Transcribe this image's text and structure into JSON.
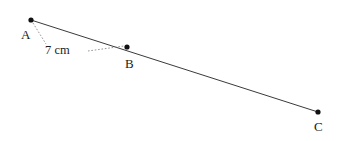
{
  "figure": {
    "kind": "geometry-line-diagram",
    "width": 339,
    "height": 141,
    "background_color": "#ffffff",
    "stroke_color": "#3a3a3a",
    "dot_color": "#111111",
    "dashed_color": "#8a8a8a"
  },
  "points": {
    "a": {
      "label": "A",
      "x": 31,
      "y": 20
    },
    "b": {
      "label": "B",
      "x": 127,
      "y": 47
    },
    "c": {
      "label": "C",
      "x": 318,
      "y": 112
    }
  },
  "segments": {
    "main_line": {
      "from": "A",
      "to": "C",
      "x1": 31,
      "y1": 20,
      "x2": 318,
      "y2": 112
    }
  },
  "annotations": {
    "measure_ab": {
      "text": "7 cm",
      "leader_left": {
        "x1": 33,
        "y1": 23,
        "x2": 46,
        "y2": 44
      },
      "leader_right": {
        "x1": 88,
        "y1": 51,
        "x2": 124,
        "y2": 46
      }
    }
  }
}
